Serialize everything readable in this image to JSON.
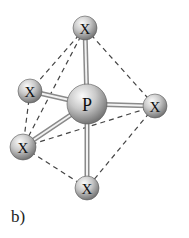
{
  "figure": {
    "label": "b)",
    "molecule": "trigonal bipyramidal PX5",
    "central_atom": {
      "symbol": "P",
      "x": 87,
      "y": 104,
      "r": 20
    },
    "ligands": [
      {
        "id": "top",
        "symbol": "X",
        "x": 85,
        "y": 28,
        "r": 12
      },
      {
        "id": "upper-left",
        "symbol": "X",
        "x": 30,
        "y": 91,
        "r": 12
      },
      {
        "id": "right",
        "symbol": "X",
        "x": 155,
        "y": 106,
        "r": 12
      },
      {
        "id": "lower-left",
        "symbol": "X",
        "x": 23,
        "y": 147,
        "r": 13
      },
      {
        "id": "bottom",
        "symbol": "X",
        "x": 87,
        "y": 188,
        "r": 12
      }
    ],
    "dashed_edges": [
      [
        "top",
        "upper-left"
      ],
      [
        "top",
        "lower-left"
      ],
      [
        "top",
        "right"
      ],
      [
        "upper-left",
        "lower-left"
      ],
      [
        "lower-left",
        "right"
      ],
      [
        "lower-left",
        "bottom"
      ],
      [
        "right",
        "bottom"
      ]
    ],
    "colors": {
      "sphere_light": "#f4f4f4",
      "sphere_dark": "#6e6e6e",
      "bond": "#9a9a9a",
      "dash": "#444444"
    }
  }
}
